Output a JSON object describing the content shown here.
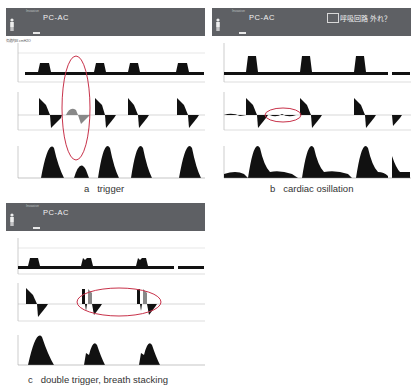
{
  "panels": [
    {
      "id": "a",
      "header": {
        "mode": "PC-AC",
        "tiny_label": "Invasive"
      },
      "caption": "a   trigger",
      "annotation": "trigger-ellipse"
    },
    {
      "id": "b",
      "header": {
        "mode": "PC-AC",
        "tiny_label": "Invasive",
        "alarm": "呼吸回路 外れ？"
      },
      "caption": "b   cardiac osillation",
      "annotation": "cardiac-oscillation-ellipse"
    },
    {
      "id": "c",
      "header": {
        "mode": "PC-AC",
        "tiny_label": "Invasive"
      },
      "caption": "c   double trigger, breath stacking",
      "annotation": "double-trigger-ellipse"
    }
  ],
  "waveforms": {
    "pressure_label": "気道内圧 cmH2O",
    "flow_label": "フロー L/min",
    "volume_label": "換気量 mL",
    "x_ticks": [
      "0",
      "2",
      "4",
      "6",
      "8"
    ]
  },
  "colors": {
    "header_bg": "#5e6064",
    "trace": "#111111",
    "highlight_trace": "#8a8a8a",
    "annotation": "#c8324a"
  }
}
